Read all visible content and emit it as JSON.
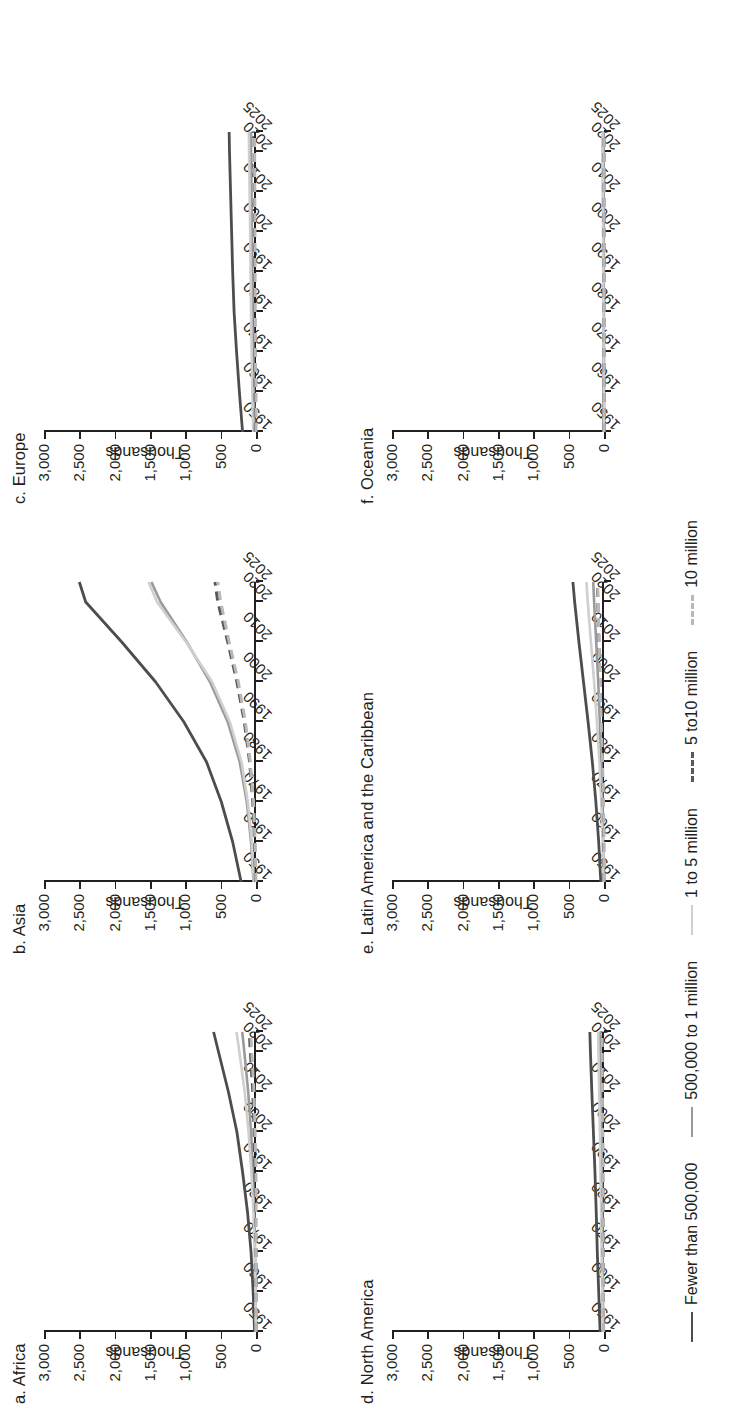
{
  "figure": {
    "y_axis_title": "Thousands",
    "y_ticks": [
      "0",
      "500",
      "1,000",
      "1,500",
      "2,000",
      "2,500",
      "3,000"
    ],
    "x_ticks": [
      "1950",
      "1960",
      "1970",
      "1980",
      "1990",
      "2000",
      "2010",
      "2020",
      "2025"
    ]
  },
  "legend": {
    "items": [
      {
        "label": "Fewer than 500,000",
        "color": "#4d4d4d",
        "style": "solid",
        "width": 2.8
      },
      {
        "label": "500,000 to 1 million",
        "color": "#9a9a9a",
        "style": "solid",
        "width": 2.6
      },
      {
        "label": "1 to 5 million",
        "color": "#cfcfcf",
        "style": "solid",
        "width": 2.6
      },
      {
        "label": "5 to10 million",
        "color": "#585858",
        "style": "dashed",
        "width": 3.0
      },
      {
        "label": "10 million",
        "color": "#b8b8b8",
        "style": "dashed",
        "width": 3.0
      }
    ]
  },
  "panels": [
    {
      "id": "africa",
      "title": "a. Africa"
    },
    {
      "id": "asia",
      "title": "b. Asia"
    },
    {
      "id": "europe",
      "title": "c. Europe"
    },
    {
      "id": "namerica",
      "title": "d. North America"
    },
    {
      "id": "lac",
      "title": "e. Latin America and the Caribbean"
    },
    {
      "id": "oceania",
      "title": "f. Oceania"
    }
  ],
  "chart_data": {
    "type": "line",
    "xlabel": "",
    "ylabel": "Thousands",
    "ylim": [
      0,
      3000
    ],
    "xlim": [
      1950,
      2025
    ],
    "grid": false,
    "legend_position": "bottom",
    "x": [
      1950,
      1960,
      1970,
      1980,
      1990,
      2000,
      2010,
      2020,
      2025
    ],
    "panels": [
      {
        "name": "a. Africa",
        "series": [
          {
            "name": "Fewer than 500,000",
            "values": [
              20,
              40,
              70,
              120,
              190,
              270,
              390,
              530,
              600
            ]
          },
          {
            "name": "500,000 to 1 million",
            "values": [
              2,
              6,
              13,
              25,
              45,
              70,
              110,
              165,
              195
            ]
          },
          {
            "name": "1 to 5 million",
            "values": [
              3,
              8,
              18,
              36,
              65,
              105,
              160,
              235,
              275
            ]
          },
          {
            "name": "5 to10 million",
            "values": [
              0,
              0,
              0,
              6,
              14,
              26,
              45,
              80,
              95
            ]
          },
          {
            "name": "10 million",
            "values": [
              0,
              0,
              0,
              0,
              0,
              13,
              28,
              60,
              75
            ]
          }
        ]
      },
      {
        "name": "b. Asia",
        "series": [
          {
            "name": "Fewer than 500,000",
            "values": [
              210,
              330,
              490,
              700,
              1020,
              1420,
              1900,
              2410,
              2500
            ]
          },
          {
            "name": "500,000 to 1 million",
            "values": [
              35,
              70,
              130,
              230,
              400,
              650,
              980,
              1350,
              1480
            ]
          },
          {
            "name": "1 to 5 million",
            "values": [
              30,
              60,
              115,
              205,
              370,
              620,
              990,
              1400,
              1520
            ]
          },
          {
            "name": "5 to10 million",
            "values": [
              8,
              20,
              45,
              90,
              165,
              270,
              400,
              540,
              580
            ]
          },
          {
            "name": "10 million",
            "values": [
              0,
              12,
              35,
              80,
              150,
              250,
              380,
              500,
              540
            ]
          }
        ]
      },
      {
        "name": "c. Europe",
        "series": [
          {
            "name": "Fewer than 500,000",
            "values": [
              190,
              235,
              275,
              310,
              330,
              345,
              360,
              375,
              380
            ]
          },
          {
            "name": "500,000 to 1 million",
            "values": [
              22,
              30,
              38,
              46,
              52,
              58,
              64,
              70,
              72
            ]
          },
          {
            "name": "1 to 5 million",
            "values": [
              40,
              52,
              62,
              70,
              76,
              82,
              90,
              98,
              101
            ]
          },
          {
            "name": "5 to10 million",
            "values": [
              10,
              13,
              16,
              18,
              20,
              21,
              23,
              25,
              26
            ]
          },
          {
            "name": "10 million",
            "values": [
              0,
              0,
              11,
              13,
              14,
              15,
              17,
              19,
              20
            ]
          }
        ]
      },
      {
        "name": "d. North America",
        "series": [
          {
            "name": "Fewer than 500,000",
            "values": [
              55,
              75,
              95,
              110,
              128,
              150,
              172,
              192,
              200
            ]
          },
          {
            "name": "500,000 to 1 million",
            "values": [
              10,
              15,
              20,
              25,
              30,
              36,
              43,
              50,
              53
            ]
          },
          {
            "name": "1 to 5 million",
            "values": [
              18,
              26,
              34,
              41,
              49,
              58,
              68,
              78,
              82
            ]
          },
          {
            "name": "5 to10 million",
            "values": [
              6,
              9,
              12,
              14,
              16,
              19,
              22,
              25,
              26
            ]
          },
          {
            "name": "10 million",
            "values": [
              8,
              11,
              14,
              16,
              18,
              21,
              24,
              27,
              28
            ]
          }
        ]
      },
      {
        "name": "e. Latin America and the Caribbean",
        "series": [
          {
            "name": "Fewer than 500,000",
            "values": [
              45,
              75,
              115,
              165,
              225,
              290,
              355,
              415,
              440
            ]
          },
          {
            "name": "500,000 to 1 million",
            "values": [
              6,
              12,
              22,
              38,
              58,
              82,
              110,
              140,
              152
            ]
          },
          {
            "name": "1 to 5 million",
            "values": [
              10,
              20,
              38,
              65,
              100,
              140,
              185,
              230,
              248
            ]
          },
          {
            "name": "5 to10 million",
            "values": [
              0,
              5,
              12,
              24,
              40,
              56,
              72,
              88,
              95
            ]
          },
          {
            "name": "10 million",
            "values": [
              0,
              0,
              8,
              22,
              40,
              56,
              70,
              84,
              90
            ]
          }
        ]
      },
      {
        "name": "f. Oceania",
        "series": [
          {
            "name": "Fewer than 500,000",
            "values": [
              3,
              4,
              5,
              6,
              7,
              8,
              10,
              12,
              13
            ]
          },
          {
            "name": "500,000 to 1 million",
            "values": [
              1,
              1,
              2,
              2,
              3,
              3,
              4,
              5,
              5
            ]
          },
          {
            "name": "1 to 5 million",
            "values": [
              4,
              6,
              8,
              10,
              12,
              14,
              17,
              20,
              21
            ]
          },
          {
            "name": "5 to10 million",
            "values": [
              0,
              0,
              0,
              0,
              0,
              0,
              0,
              0,
              0
            ]
          },
          {
            "name": "10 million",
            "values": [
              0,
              0,
              0,
              0,
              0,
              0,
              0,
              0,
              0
            ]
          }
        ]
      }
    ]
  }
}
